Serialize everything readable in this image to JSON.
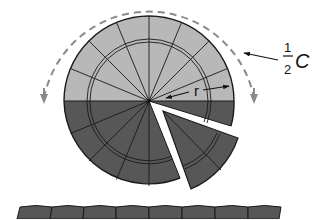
{
  "diagram": {
    "labels": {
      "half_numerator": "1",
      "half_denominator": "2",
      "circumference_symbol": "C",
      "radius_symbol": "r"
    },
    "circle": {
      "center": [
        149,
        101
      ],
      "outer_radius": 85,
      "inner_ring_radii": [
        59,
        62
      ],
      "sector_count": 16,
      "top_half_color": "#b8b8b8",
      "bottom_half_color": "#575757",
      "divider_color": "#1a1a1a"
    },
    "detached_sector": {
      "description": "One wedge pulled out from the lower-right of the circle",
      "color": "#575757"
    },
    "dashed_arc": {
      "description": "Dashed arc over the top half with arrowheads at both ends, labelled one half of C",
      "color": "#8a8a8a"
    },
    "bottom_strip": {
      "description": "Sectors laid out in a row along the bottom",
      "piece_count": 8,
      "color": "#575757"
    }
  }
}
